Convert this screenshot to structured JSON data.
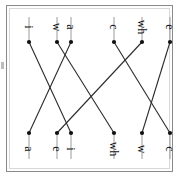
{
  "figure": {
    "type": "bipartite-matching-diagram",
    "orientation": "rotated-90",
    "background_color": "#ffffff",
    "frame_color": "#8a8a8a",
    "edge_color": "#2b2b2b",
    "node_color": "#111111",
    "stem_color": "#9a9a9a"
  },
  "top_row": {
    "name": "top-node-row",
    "y": 33,
    "stem_from": 8,
    "nodes": [
      {
        "id": "t0",
        "label": "i",
        "x": 19
      },
      {
        "id": "t1",
        "label": "w",
        "x": 47
      },
      {
        "id": "t2",
        "label": "a",
        "x": 61
      },
      {
        "id": "t3",
        "label": "c",
        "x": 104
      },
      {
        "id": "t4",
        "label": "wh",
        "x": 132
      },
      {
        "id": "t5",
        "label": "e",
        "x": 160
      }
    ]
  },
  "bottom_row": {
    "name": "bottom-node-row",
    "y": 124,
    "stem_to": 150,
    "nodes": [
      {
        "id": "b0",
        "label": "a",
        "x": 19
      },
      {
        "id": "b1",
        "label": "e",
        "x": 47
      },
      {
        "id": "b2",
        "label": "i",
        "x": 61
      },
      {
        "id": "b3",
        "label": "wh",
        "x": 104
      },
      {
        "id": "b4",
        "label": "w",
        "x": 132
      },
      {
        "id": "b5",
        "label": "c",
        "x": 160
      }
    ]
  },
  "edges": [
    {
      "from": "t0",
      "to": "b2",
      "from_label": "i",
      "to_label": "i"
    },
    {
      "from": "t1",
      "to": "b3",
      "from_label": "w",
      "to_label": "wh"
    },
    {
      "from": "t2",
      "to": "b0",
      "from_label": "a",
      "to_label": "a"
    },
    {
      "from": "t3",
      "to": "b5",
      "from_label": "c",
      "to_label": "c"
    },
    {
      "from": "t4",
      "to": "b1",
      "from_label": "wh",
      "to_label": "e"
    },
    {
      "from": "t5",
      "to": "b4",
      "from_label": "e",
      "to_label": "w"
    }
  ]
}
